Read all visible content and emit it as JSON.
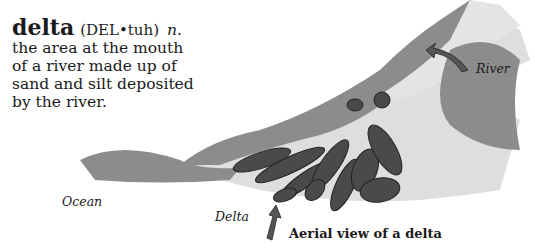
{
  "entry": {
    "term": "delta",
    "pronunciation": "(DEL•tuh)",
    "part_of_speech": "n.",
    "definition": "the area at the mouth of a river made up of sand and silt deposited by the river."
  },
  "illustration": {
    "labels": {
      "river": "River",
      "ocean": "Ocean",
      "delta": "Delta"
    },
    "caption": "Aerial view of a delta",
    "colors": {
      "land": "#8a8a8a",
      "water": "#dcdcdc",
      "islands": "#4a4a4a",
      "arrow": "#555555"
    }
  }
}
